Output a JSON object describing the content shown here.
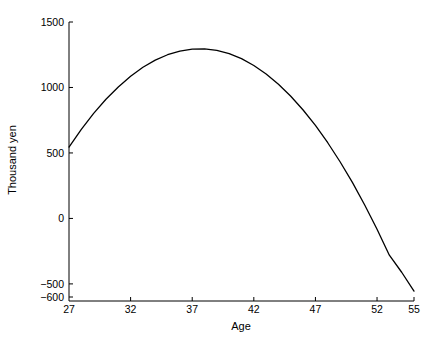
{
  "chart_data": {
    "type": "line",
    "title": "",
    "subtitle": "",
    "xlabel": "Age",
    "ylabel": "Thousand yen",
    "xlim": [
      27,
      55
    ],
    "ylim": [
      -600,
      1500
    ],
    "xticks": [
      27,
      32,
      37,
      42,
      47,
      52,
      55
    ],
    "xtick_labels": [
      "27",
      "32",
      "37",
      "42",
      "47",
      "52",
      "55"
    ],
    "yticks": [
      -600,
      -500,
      0,
      500,
      1000,
      1500
    ],
    "ytick_labels": [
      "-600",
      "-500",
      "0",
      "500",
      "1000",
      "1500"
    ],
    "grid": false,
    "legend": "none",
    "line_color": "#000000",
    "line_width": 1.3,
    "axis_color": "#000000",
    "background": "#ffffff",
    "annotations": [],
    "series": [
      {
        "name": "Earnings profile",
        "x": [
          27,
          28,
          29,
          30,
          31,
          32,
          33,
          34,
          35,
          36,
          37,
          38,
          39,
          40,
          41,
          42,
          43,
          44,
          45,
          46,
          47,
          48,
          49,
          50,
          51,
          52,
          53,
          54,
          55
        ],
        "values": [
          545,
          680,
          802,
          910,
          1004,
          1086,
          1154,
          1209,
          1250,
          1278,
          1293,
          1295,
          1283,
          1258,
          1220,
          1168,
          1103,
          1025,
          933,
          828,
          710,
          578,
          433,
          275,
          103,
          -82,
          -281,
          -411,
          -555
        ]
      }
    ]
  },
  "axis_titles": {
    "x": "Age",
    "y": "Thousand yen"
  }
}
